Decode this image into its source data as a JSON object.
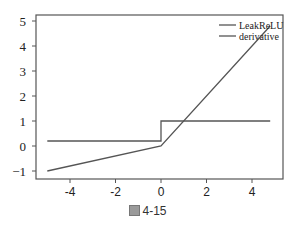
{
  "chart_data": {
    "type": "line",
    "title": "",
    "xlabel": "",
    "ylabel": "",
    "xlim": [
      -5,
      5
    ],
    "ylim": [
      -1.2,
      5.2
    ],
    "xticks": [
      -4,
      -2,
      0,
      2,
      4
    ],
    "yticks": [
      -1,
      0,
      1,
      2,
      3,
      4,
      5
    ],
    "xtick_labels": [
      "-4",
      "-2",
      "0",
      "2",
      "4"
    ],
    "ytick_labels": [
      "-1",
      "0",
      "1",
      "2",
      "3",
      "4",
      "5"
    ],
    "grid": false,
    "legend_position": "upper right",
    "series": [
      {
        "name": "LeakReLU",
        "color": "#555555",
        "x": [
          -5,
          0,
          4.8
        ],
        "y": [
          -1,
          0,
          4.8
        ]
      },
      {
        "name": "derivative",
        "color": "#555555",
        "x": [
          -5,
          0,
          0,
          4.8
        ],
        "y": [
          0.2,
          0.2,
          1,
          1
        ]
      }
    ]
  },
  "caption": {
    "label": "4-15",
    "icon": "figure-icon"
  }
}
